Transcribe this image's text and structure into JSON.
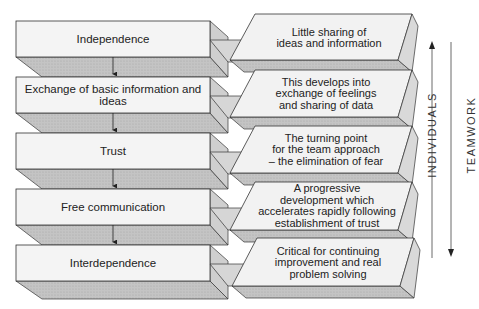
{
  "stages": [
    {
      "label": "Independence",
      "description": [
        "Little sharing of",
        "ideas and information"
      ]
    },
    {
      "label": "Exchange of basic information and ideas",
      "description": [
        "This develops into",
        "exchange of feelings",
        "and sharing of data"
      ]
    },
    {
      "label": "Trust",
      "description": [
        "The turning point",
        "for the team approach",
        "– the elimination of fear"
      ]
    },
    {
      "label": "Free communication",
      "description": [
        "A progressive",
        "development which",
        "accelerates rapidly following",
        "establishment of trust"
      ]
    },
    {
      "label": "Interdependence",
      "description": [
        "Critical for continuing",
        "improvement and real",
        "problem solving"
      ]
    }
  ],
  "axes": {
    "individuals": "INDIVIDUALS",
    "teamwork": "TEAMWORK"
  },
  "colors": {
    "face": "#f2f2f2",
    "shadow": "#bdbdbd",
    "side": "#cfcfcf",
    "stroke": "#333333"
  }
}
